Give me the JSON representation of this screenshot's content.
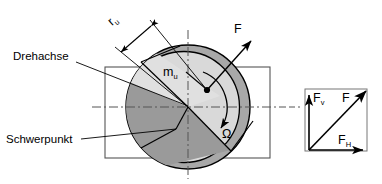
{
  "figure": {
    "labels": {
      "drehachse": "Drehachse",
      "schwerpunkt": "Schwerpunkt",
      "radius_unwucht": "r",
      "radius_unwucht_sub": "u",
      "masse_unwucht": "m",
      "masse_unwucht_sub": "u",
      "omega": "Ω",
      "force": "F"
    },
    "colors": {
      "outline": "#000000",
      "ring_fill": "#a8a8a8",
      "disc_fill": "#d9d9d9",
      "sector_fill": "#9a9a9a",
      "housing_stroke": "#555555",
      "centerline": "#555555",
      "background": "#ffffff"
    }
  },
  "force_triangle": {
    "vertical_label": "F",
    "vertical_sub": "v",
    "resultant_label": "F",
    "horizontal_label": "F",
    "horizontal_sub": "H"
  }
}
